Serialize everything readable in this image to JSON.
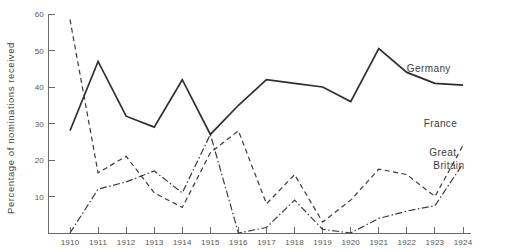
{
  "chart_data": {
    "type": "line",
    "title": "",
    "subtitle": "",
    "xlabel": "",
    "ylabel": "Percentage of nominations received",
    "xlim": [
      1910,
      1924
    ],
    "ylim": [
      0,
      60
    ],
    "ytick_labels": [
      "60",
      "50",
      "40",
      "30",
      "20",
      "10"
    ],
    "ytick_values": [
      60,
      50,
      40,
      30,
      20,
      10
    ],
    "ytick_step": 10,
    "grid": false,
    "legend_position": "inline-right-of-line-ends",
    "categories": [
      1910,
      1911,
      1912,
      1913,
      1914,
      1915,
      1916,
      1917,
      1918,
      1919,
      1920,
      1921,
      1922,
      1923,
      1924
    ],
    "xtick_labels": [
      "1910",
      "1911",
      "1912",
      "1913",
      "1914",
      "1915",
      "1916",
      "1917",
      "1918",
      "1919",
      "1920",
      "1921",
      "1922",
      "1923",
      "1924"
    ],
    "series": [
      {
        "name": "Germany",
        "style": "solid",
        "color": "#2e2e2e",
        "label": "Germany",
        "label_x": 1922.0,
        "label_y": 44.0,
        "values": [
          28,
          47,
          32,
          29,
          42,
          27,
          35,
          42,
          41,
          40,
          36,
          50.5,
          44,
          41,
          40.5
        ]
      },
      {
        "name": "France",
        "style": "dashed",
        "color": "#3a3a3a",
        "label": "France",
        "label_x": 1922.6,
        "label_y": 29.0,
        "values": [
          58.5,
          16.5,
          21,
          11,
          7,
          22,
          28,
          8,
          16,
          3,
          9,
          17.5,
          16,
          10,
          24
        ]
      },
      {
        "name": "Great Britain",
        "style": "dashdot",
        "color": "#3a3a3a",
        "label": "Great Britain",
        "label_line1": "Great",
        "label_line2": "Britain",
        "label_x": 1922.8,
        "label_y": 21.0,
        "values": [
          0,
          12,
          14,
          17,
          11,
          27,
          0,
          1.5,
          9,
          1,
          0,
          4,
          6,
          7.5,
          19
        ]
      }
    ],
    "note": "Percentage of nominations received per country, 1910-1924"
  },
  "axis": {
    "y_axis_title": "Percentage of nominations received"
  },
  "labels": {
    "germany": "Germany",
    "france": "France",
    "great_line1": "Great",
    "great_line2": "Britain"
  }
}
